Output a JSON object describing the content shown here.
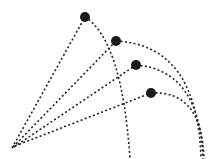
{
  "diagram": {
    "type": "projectile-trajectories",
    "background": "#ffffff",
    "line_color": "#222222",
    "ball_color": "#1a1a1a",
    "origin": {
      "x": 12,
      "y": 148
    },
    "trajectories": [
      {
        "id": 1,
        "ball": {
          "x": 85,
          "y": 17,
          "r": 5
        },
        "landing": {
          "x": 130,
          "y": 159
        }
      },
      {
        "id": 2,
        "ball": {
          "x": 116,
          "y": 41,
          "r": 5
        },
        "landing": {
          "x": 201,
          "y": 159
        }
      },
      {
        "id": 3,
        "ball": {
          "x": 136,
          "y": 65,
          "r": 5
        },
        "landing": {
          "x": 203,
          "y": 159
        }
      },
      {
        "id": 4,
        "ball": {
          "x": 151,
          "y": 93,
          "r": 5
        },
        "landing": {
          "x": 204,
          "y": 159
        }
      }
    ]
  }
}
